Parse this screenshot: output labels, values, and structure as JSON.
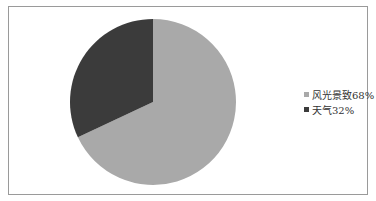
{
  "chart_data": {
    "type": "pie",
    "title": "",
    "categories": [
      "风光景致",
      "天气"
    ],
    "values": [
      68,
      32
    ],
    "unit": "%",
    "colors": [
      "#a9a9a9",
      "#3b3b3b"
    ],
    "legend_position": "right",
    "start_angle_deg": 0,
    "direction": "clockwise"
  },
  "legend": {
    "items": [
      {
        "label": "风光景致68%",
        "color": "#a9a9a9"
      },
      {
        "label": "天气32%",
        "color": "#3b3b3b"
      }
    ]
  }
}
